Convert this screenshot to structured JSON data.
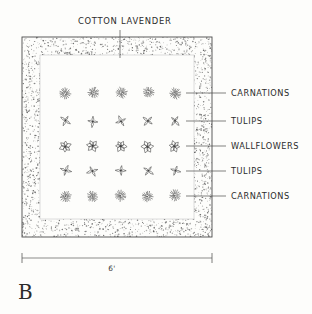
{
  "drawing": {
    "key_letter": "B",
    "title_callout": "COTTON LAVENDER",
    "dimension_label": "6'",
    "plan_type": "garden bed planting plan"
  },
  "callouts": [
    {
      "label": "CARNATIONS",
      "row": 1
    },
    {
      "label": "TULIPS",
      "row": 2
    },
    {
      "label": "WALLFLOWERS",
      "row": 3
    },
    {
      "label": "TULIPS",
      "row": 4
    },
    {
      "label": "CARNATIONS",
      "row": 5
    }
  ],
  "icons": {
    "border": "stipple-border-icon",
    "carnation": "carnation-bloom-icon",
    "tulip": "tulip-bloom-icon",
    "wallflower": "wallflower-bloom-icon",
    "dimension": "dimension-line-icon"
  },
  "colors": {
    "ink": "#3a3a3a",
    "line": "#4a4a4a",
    "paper": "#fdfdfb",
    "stipple": "#555555"
  },
  "chart_data": {
    "type": "table",
    "xlabel": "6'",
    "ylabel": "",
    "categories": [
      "col 1",
      "col 2",
      "col 3",
      "col 4",
      "col 5"
    ],
    "series": [
      {
        "name": "CARNATIONS",
        "values": [
          1,
          1,
          1,
          1,
          1
        ]
      },
      {
        "name": "TULIPS",
        "values": [
          1,
          1,
          1,
          1,
          1
        ]
      },
      {
        "name": "WALLFLOWERS",
        "values": [
          1,
          1,
          1,
          1,
          1
        ]
      },
      {
        "name": "TULIPS",
        "values": [
          1,
          1,
          1,
          1,
          1
        ]
      },
      {
        "name": "CARNATIONS",
        "values": [
          1,
          1,
          1,
          1,
          1
        ]
      }
    ],
    "annotations": [
      "COTTON LAVENDER",
      "6'",
      "B"
    ],
    "legend": [
      "CARNATIONS",
      "TULIPS",
      "WALLFLOWERS",
      "TULIPS",
      "CARNATIONS"
    ],
    "grid": false
  }
}
